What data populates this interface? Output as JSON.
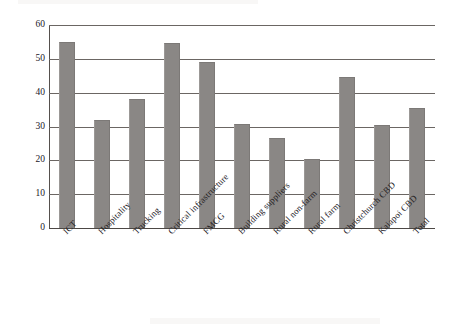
{
  "chart_data": {
    "type": "bar",
    "title": "",
    "xlabel": "",
    "ylabel": "Response rate (%)",
    "ylim": [
      0,
      60
    ],
    "yticks": [
      0,
      10,
      20,
      30,
      40,
      50,
      60
    ],
    "ytick_labels": [
      "0",
      "10",
      "20",
      "30",
      "40",
      "50",
      "60"
    ],
    "grid": true,
    "legend": "none",
    "bar_color": "#8a8785",
    "categories": [
      "ICT",
      "Hospitality",
      "Trucking",
      "Critical infrastructure",
      "FMCG",
      "Building suppliers",
      "Rural non-farm",
      "Rural farm",
      "Christchurch CBD",
      "Kaiapoi CBD",
      "Total"
    ],
    "values": [
      55.0,
      32.0,
      38.0,
      54.8,
      49.0,
      30.7,
      26.5,
      20.5,
      44.5,
      30.4,
      35.4
    ]
  },
  "axis": {
    "y_title": "Response rate (%)"
  }
}
